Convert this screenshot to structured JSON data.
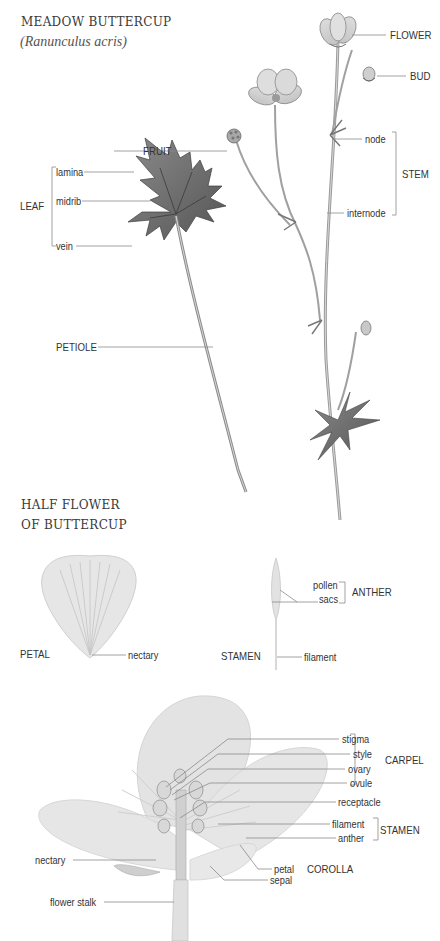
{
  "header": {
    "title": "MEADOW BUTTERCUP",
    "subtitle": "(Ranunculus acris)"
  },
  "plant": {
    "labels": {
      "flower": "FLOWER",
      "bud": "BUD",
      "fruit": "FRUIT",
      "stem": "STEM",
      "node": "node",
      "internode": "internode",
      "leaf": "LEAF",
      "lamina": "lamina",
      "midrib": "midrib",
      "vein": "vein",
      "petiole": "PETIOLE"
    }
  },
  "half_flower_section": {
    "title_line1": "HALF FLOWER",
    "title_line2": "OF BUTTERCUP",
    "petal": {
      "label": "PETAL",
      "nectary": "nectary"
    },
    "stamen": {
      "label": "STAMEN",
      "pollen": "pollen",
      "sacs": "sacs",
      "anther_group": "ANTHER",
      "filament": "filament"
    },
    "cross_section": {
      "carpel_group": "CARPEL",
      "carpel_parts": [
        "stigma",
        "style",
        "ovary",
        "ovule"
      ],
      "receptacle": "receptacle",
      "stamen_group": "STAMEN",
      "stamen_parts": [
        "filament",
        "anther"
      ],
      "corolla_group": "COROLLA",
      "petal": "petal",
      "sepal": "sepal",
      "nectary": "nectary",
      "flower_stalk": "flower stalk"
    }
  },
  "colors": {
    "ink": "#333333",
    "leader_line": "#8a8a8a",
    "petal_fill": "#e4e4e4",
    "leaf_fill": "#6f6f6f"
  }
}
